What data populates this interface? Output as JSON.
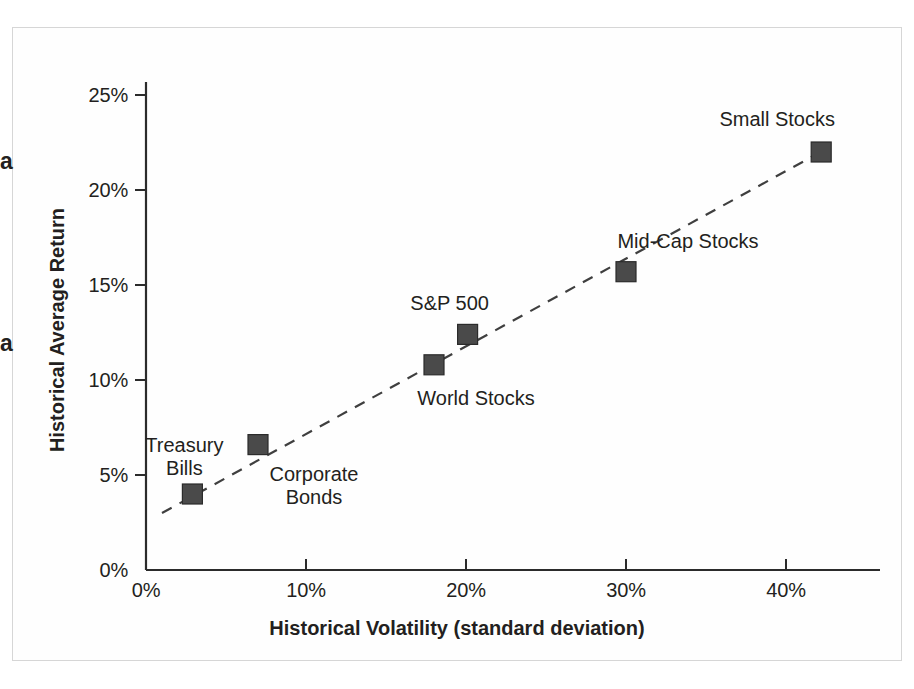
{
  "chart_data": {
    "type": "scatter",
    "title": "",
    "xlabel": "Historical Volatility (standard deviation)",
    "ylabel": "Historical Average Return",
    "xlim": [
      0,
      45
    ],
    "ylim": [
      0,
      27
    ],
    "grid": false,
    "legend": "none",
    "xticks": [
      "0%",
      "10%",
      "20%",
      "30%",
      "40%"
    ],
    "xtick_values": [
      0,
      10,
      20,
      30,
      40
    ],
    "yticks": [
      "0%",
      "5%",
      "10%",
      "15%",
      "20%",
      "25%"
    ],
    "ytick_values": [
      0,
      5,
      10,
      15,
      20,
      25
    ],
    "points": [
      {
        "name": "Treasury Bills",
        "x": 2.9,
        "y": 4.0,
        "label": "Treasury\nBills",
        "label_dx": -8,
        "label_dy": -60,
        "marker_color": "#4a4a4a"
      },
      {
        "name": "Corporate Bonds",
        "x": 7.0,
        "y": 6.6,
        "label": "Corporate\nBonds",
        "label_dx": 56,
        "label_dy": 18,
        "marker_color": "#4a4a4a"
      },
      {
        "name": "World Stocks",
        "x": 18.0,
        "y": 10.8,
        "label": "World Stocks",
        "label_dx": 42,
        "label_dy": 22,
        "marker_color": "#4a4a4a"
      },
      {
        "name": "S&P 500",
        "x": 20.1,
        "y": 12.4,
        "label": "S&P 500",
        "label_dx": -18,
        "label_dy": -42,
        "marker_color": "#4a4a4a"
      },
      {
        "name": "Mid-Cap Stocks",
        "x": 30.0,
        "y": 15.7,
        "label": "Mid-Cap Stocks",
        "label_dx": 62,
        "label_dy": -42,
        "marker_color": "#4a4a4a"
      },
      {
        "name": "Small Stocks",
        "x": 42.2,
        "y": 22.0,
        "label": "Small Stocks",
        "label_dx": -44,
        "label_dy": -44,
        "marker_color": "#4a4a4a"
      }
    ],
    "trendline": {
      "style": "dashed",
      "x_start": 1.0,
      "y_start": 3.0,
      "x_end": 42.6,
      "y_end": 22.2,
      "color": "#3f3f3f"
    },
    "annotations": {
      "edge_marks": [
        "a",
        "a"
      ]
    }
  },
  "colors": {
    "axis": "#2b2b2b",
    "marker": "#4a4a4a",
    "text": "#231f20",
    "frame": "#d6d6d6",
    "background": "#ffffff"
  }
}
